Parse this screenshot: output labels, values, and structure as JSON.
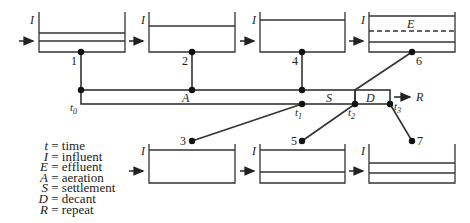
{
  "diagram": {
    "influent_label": "I",
    "effluent_label": "E",
    "phases": {
      "aeration": "A",
      "settlement": "S",
      "decant": "D",
      "repeat": "R"
    },
    "time_labels": [
      "t0",
      "t1",
      "t2",
      "t3"
    ],
    "tanks_top": [
      {
        "id": "1",
        "state": "filling, two levels"
      },
      {
        "id": "2",
        "state": "full"
      },
      {
        "id": "4",
        "state": "full"
      },
      {
        "id": "6",
        "state": "decanting, effluent layer"
      }
    ],
    "tanks_bottom": [
      {
        "id": "3",
        "state": "full"
      },
      {
        "id": "5",
        "state": "settled"
      },
      {
        "id": "7",
        "state": "low level"
      }
    ],
    "node_labels": [
      "1",
      "2",
      "3",
      "4",
      "5",
      "6",
      "7"
    ]
  },
  "legend": [
    {
      "key": "t",
      "text": "= time"
    },
    {
      "key": "I",
      "text": "= influent"
    },
    {
      "key": "E",
      "text": "= effluent"
    },
    {
      "key": "A",
      "text": "= aeration"
    },
    {
      "key": "S",
      "text": "= settlement"
    },
    {
      "key": "D",
      "text": "= decant"
    },
    {
      "key": "R",
      "text": "= repeat"
    }
  ]
}
